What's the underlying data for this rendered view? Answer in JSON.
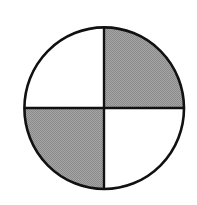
{
  "diagram": {
    "type": "quartered-circle",
    "quadrants": [
      {
        "position": "top-left",
        "filled": false
      },
      {
        "position": "top-right",
        "filled": true
      },
      {
        "position": "bottom-left",
        "filled": true
      },
      {
        "position": "bottom-right",
        "filled": false
      }
    ],
    "colors": {
      "fill": "#9a9a9a",
      "stroke": "#111111",
      "background": "#ffffff"
    }
  }
}
